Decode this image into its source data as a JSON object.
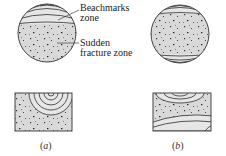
{
  "figure": {
    "annotations": {
      "beachmarks": {
        "line1": "Beachmarks",
        "line2": "zone"
      },
      "sudden": {
        "line1": "Sudden",
        "line2": "fracture zone"
      }
    },
    "panels": [
      {
        "id": "a",
        "caption_open": "(",
        "caption_letter": "a",
        "caption_close": ")"
      },
      {
        "id": "b",
        "caption_open": "(",
        "caption_letter": "b",
        "caption_close": ")"
      }
    ]
  },
  "colors": {
    "fill": "#d9d9d9",
    "stroke": "#444444",
    "speckle": "#333333"
  }
}
